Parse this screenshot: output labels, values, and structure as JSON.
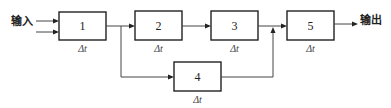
{
  "diagram": {
    "input_label": "输入",
    "output_label": "输出",
    "blocks": [
      {
        "id": "1",
        "label": "1",
        "delay": "Δt"
      },
      {
        "id": "2",
        "label": "2",
        "delay": "Δt"
      },
      {
        "id": "3",
        "label": "3",
        "delay": "Δt"
      },
      {
        "id": "4",
        "label": "4",
        "delay": "Δt"
      },
      {
        "id": "5",
        "label": "5",
        "delay": "Δt"
      }
    ],
    "edges": [
      {
        "from": "输入",
        "to": "1",
        "count": 2
      },
      {
        "from": "1",
        "to": "2"
      },
      {
        "from": "1",
        "to": "4"
      },
      {
        "from": "2",
        "to": "3"
      },
      {
        "from": "3",
        "to": "5"
      },
      {
        "from": "4",
        "to": "5"
      },
      {
        "from": "5",
        "to": "输出"
      }
    ]
  }
}
